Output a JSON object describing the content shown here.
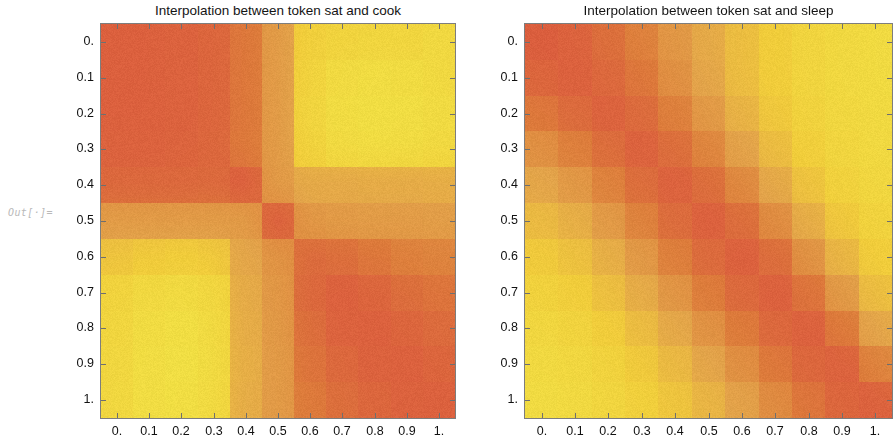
{
  "notebook": {
    "out_label": "Out[·]=",
    "background": "#ffffff"
  },
  "panels": [
    {
      "id": "left",
      "title": "Interpolation between token sat and cook",
      "frame": {
        "x": 100,
        "y": 23,
        "w": 356,
        "h": 396
      },
      "axis_color": "#7d7d7d"
    },
    {
      "id": "right",
      "title": "Interpolation between token sat and sleep",
      "frame": {
        "x": 524,
        "y": 23,
        "w": 369,
        "h": 396
      },
      "axis_color": "#7d7d7d"
    }
  ],
  "axes": {
    "x_ticks": [
      "0.",
      "0.1",
      "0.2",
      "0.3",
      "0.4",
      "0.5",
      "0.6",
      "0.7",
      "0.8",
      "0.9",
      "1."
    ],
    "y_ticks": [
      "0.",
      "0.1",
      "0.2",
      "0.3",
      "0.4",
      "0.5",
      "0.6",
      "0.7",
      "0.8",
      "0.9",
      "1."
    ],
    "x_values": [
      0,
      0.1,
      0.2,
      0.3,
      0.4,
      0.5,
      0.6,
      0.7,
      0.8,
      0.9,
      1
    ],
    "y_values": [
      0,
      0.1,
      0.2,
      0.3,
      0.4,
      0.5,
      0.6,
      0.7,
      0.8,
      0.9,
      1
    ]
  },
  "colormap": {
    "name": "yellow-orange-red",
    "stops": [
      {
        "t": 0.0,
        "hex": "#f6e94a"
      },
      {
        "t": 0.25,
        "hex": "#f6d23f"
      },
      {
        "t": 0.5,
        "hex": "#e8a94e"
      },
      {
        "t": 0.75,
        "hex": "#e2813f"
      },
      {
        "t": 1.0,
        "hex": "#e05c43"
      }
    ],
    "noise_amplitude": 11
  },
  "chart_data": {
    "type": "heatmap",
    "xlabel": "",
    "ylabel": "",
    "xlim": [
      0,
      1
    ],
    "ylim": [
      0,
      1
    ],
    "grid": false,
    "legend": "none",
    "colorbar": false,
    "x": [
      0,
      0.1,
      0.2,
      0.3,
      0.4,
      0.5,
      0.6,
      0.7,
      0.8,
      0.9,
      1
    ],
    "y": [
      0,
      0.1,
      0.2,
      0.3,
      0.4,
      0.5,
      0.6,
      0.7,
      0.8,
      0.9,
      1
    ],
    "panels": [
      {
        "name": "Interpolation between token sat and cook",
        "z": [
          [
            0.93,
            0.93,
            0.92,
            0.9,
            0.78,
            0.55,
            0.22,
            0.18,
            0.16,
            0.16,
            0.12
          ],
          [
            0.93,
            0.93,
            0.92,
            0.9,
            0.78,
            0.55,
            0.18,
            0.1,
            0.08,
            0.09,
            0.12
          ],
          [
            0.93,
            0.93,
            0.92,
            0.9,
            0.78,
            0.55,
            0.16,
            0.08,
            0.06,
            0.07,
            0.1
          ],
          [
            0.92,
            0.92,
            0.91,
            0.89,
            0.77,
            0.55,
            0.18,
            0.1,
            0.08,
            0.09,
            0.12
          ],
          [
            0.88,
            0.88,
            0.88,
            0.87,
            0.93,
            0.56,
            0.46,
            0.46,
            0.45,
            0.45,
            0.44
          ],
          [
            0.55,
            0.55,
            0.55,
            0.55,
            0.56,
            0.92,
            0.58,
            0.56,
            0.55,
            0.55,
            0.54
          ],
          [
            0.3,
            0.26,
            0.24,
            0.26,
            0.48,
            0.6,
            0.86,
            0.84,
            0.78,
            0.72,
            0.7
          ],
          [
            0.18,
            0.12,
            0.1,
            0.13,
            0.45,
            0.58,
            0.88,
            0.93,
            0.9,
            0.84,
            0.8
          ],
          [
            0.16,
            0.09,
            0.06,
            0.1,
            0.44,
            0.57,
            0.84,
            0.92,
            0.93,
            0.9,
            0.86
          ],
          [
            0.15,
            0.08,
            0.05,
            0.09,
            0.43,
            0.56,
            0.8,
            0.88,
            0.92,
            0.93,
            0.9
          ],
          [
            0.14,
            0.08,
            0.06,
            0.1,
            0.44,
            0.56,
            0.76,
            0.84,
            0.89,
            0.92,
            0.93
          ]
        ]
      },
      {
        "name": "Interpolation between token sat and sleep",
        "z": [
          [
            0.95,
            0.92,
            0.84,
            0.72,
            0.58,
            0.46,
            0.34,
            0.24,
            0.16,
            0.12,
            0.1
          ],
          [
            0.9,
            0.93,
            0.88,
            0.78,
            0.62,
            0.48,
            0.34,
            0.24,
            0.16,
            0.12,
            0.1
          ],
          [
            0.78,
            0.86,
            0.92,
            0.86,
            0.72,
            0.56,
            0.4,
            0.27,
            0.18,
            0.13,
            0.11
          ],
          [
            0.62,
            0.72,
            0.84,
            0.92,
            0.84,
            0.68,
            0.5,
            0.34,
            0.22,
            0.15,
            0.12
          ],
          [
            0.48,
            0.56,
            0.7,
            0.84,
            0.92,
            0.84,
            0.66,
            0.46,
            0.3,
            0.19,
            0.14
          ],
          [
            0.36,
            0.42,
            0.55,
            0.7,
            0.85,
            0.93,
            0.84,
            0.64,
            0.43,
            0.27,
            0.18
          ],
          [
            0.26,
            0.31,
            0.42,
            0.56,
            0.72,
            0.86,
            0.93,
            0.84,
            0.6,
            0.38,
            0.24
          ],
          [
            0.19,
            0.23,
            0.32,
            0.44,
            0.58,
            0.74,
            0.87,
            0.93,
            0.8,
            0.55,
            0.33
          ],
          [
            0.14,
            0.17,
            0.24,
            0.34,
            0.46,
            0.6,
            0.75,
            0.88,
            0.93,
            0.76,
            0.48
          ],
          [
            0.11,
            0.13,
            0.18,
            0.26,
            0.36,
            0.48,
            0.62,
            0.77,
            0.89,
            0.92,
            0.7
          ],
          [
            0.09,
            0.11,
            0.15,
            0.21,
            0.29,
            0.39,
            0.51,
            0.65,
            0.79,
            0.9,
            0.93
          ]
        ]
      }
    ]
  }
}
